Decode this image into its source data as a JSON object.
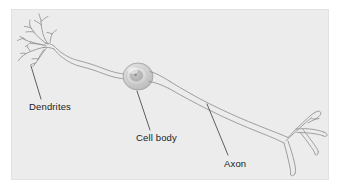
{
  "figure": {
    "panel": {
      "background_color": "#ececec",
      "outer_background_color": "#ffffff",
      "border_color": "#e0e0e0"
    },
    "ink_color": "#8f8f8f",
    "label_color": "#1a1a1a"
  },
  "labels": {
    "dendrites": "Dendrites",
    "cell_body": "Cell body",
    "axon": "Axon"
  },
  "parts": {
    "dendrites_name": "dendrites",
    "soma_name": "cell body",
    "axon_name": "axon",
    "axon_terminals_name": "axon terminals",
    "nucleus_name": "nucleus"
  }
}
